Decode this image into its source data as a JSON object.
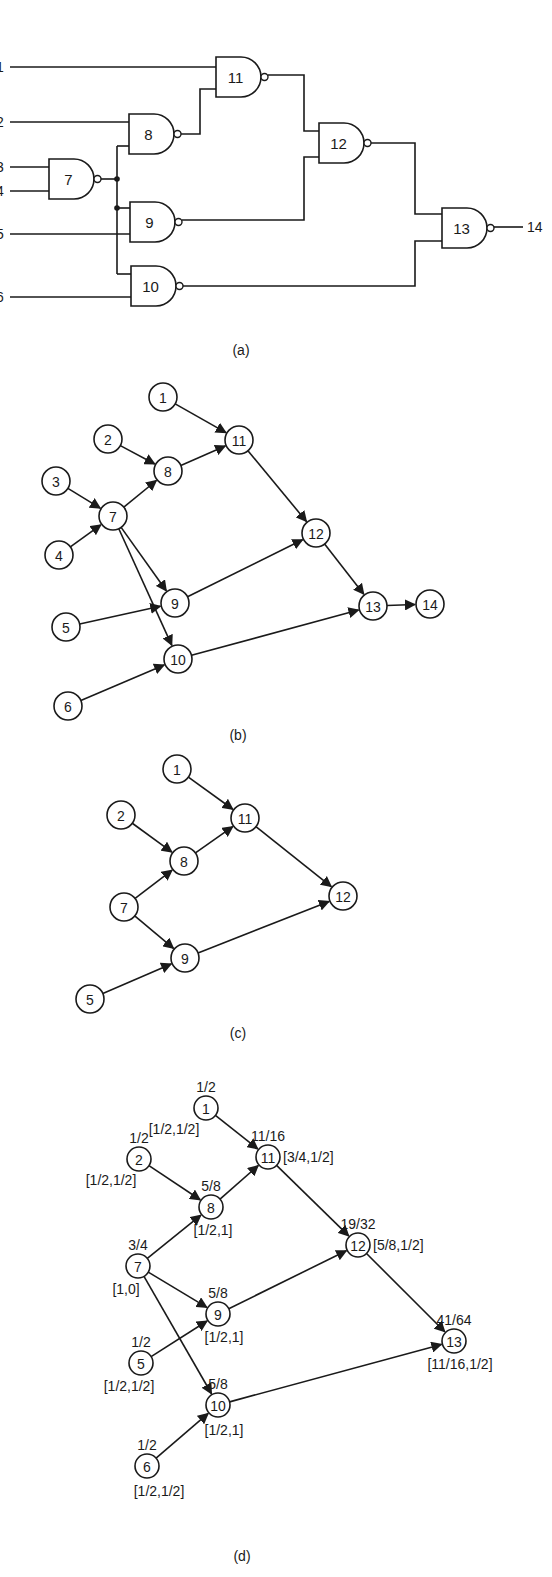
{
  "figure": {
    "panel_a": {
      "caption": "(a)",
      "input_labels": [
        {
          "id": "1",
          "label": "1",
          "x": 0,
          "y": 67
        },
        {
          "id": "2",
          "label": "2",
          "x": 0,
          "y": 122
        },
        {
          "id": "3",
          "label": "3",
          "x": 0,
          "y": 167
        },
        {
          "id": "4",
          "label": "4",
          "x": 0,
          "y": 191
        },
        {
          "id": "5",
          "label": "5",
          "x": 0,
          "y": 234
        },
        {
          "id": "6",
          "label": "6",
          "x": 0,
          "y": 297
        }
      ],
      "gates": [
        {
          "id": "7",
          "label": "7",
          "type": "NAND",
          "x": 49,
          "y": 159,
          "w": 45,
          "h": 40
        },
        {
          "id": "8",
          "label": "8",
          "type": "NAND",
          "x": 129,
          "y": 114,
          "w": 45,
          "h": 40
        },
        {
          "id": "9",
          "label": "9",
          "type": "NAND",
          "x": 130,
          "y": 202,
          "w": 45,
          "h": 40
        },
        {
          "id": "10",
          "label": "10",
          "type": "NAND",
          "x": 131,
          "y": 266,
          "w": 45,
          "h": 40
        },
        {
          "id": "11",
          "label": "11",
          "type": "NAND",
          "x": 216,
          "y": 57,
          "w": 45,
          "h": 40
        },
        {
          "id": "12",
          "label": "12",
          "type": "NAND",
          "x": 319,
          "y": 123,
          "w": 45,
          "h": 40
        },
        {
          "id": "13",
          "label": "13",
          "type": "NAND",
          "x": 442,
          "y": 208,
          "w": 45,
          "h": 40
        }
      ],
      "output_label": "14"
    },
    "panel_b": {
      "caption": "(b)",
      "nodes": [
        {
          "id": "1",
          "label": "1",
          "x": 163,
          "y": 397
        },
        {
          "id": "2",
          "label": "2",
          "x": 108,
          "y": 439
        },
        {
          "id": "3",
          "label": "3",
          "x": 56,
          "y": 481
        },
        {
          "id": "4",
          "label": "4",
          "x": 59,
          "y": 555
        },
        {
          "id": "5",
          "label": "5",
          "x": 66,
          "y": 627
        },
        {
          "id": "6",
          "label": "6",
          "x": 68,
          "y": 706
        },
        {
          "id": "7",
          "label": "7",
          "x": 113,
          "y": 516
        },
        {
          "id": "8",
          "label": "8",
          "x": 168,
          "y": 471
        },
        {
          "id": "9",
          "label": "9",
          "x": 175,
          "y": 603
        },
        {
          "id": "10",
          "label": "10",
          "x": 178,
          "y": 659
        },
        {
          "id": "11",
          "label": "11",
          "x": 239,
          "y": 440
        },
        {
          "id": "12",
          "label": "12",
          "x": 316,
          "y": 533
        },
        {
          "id": "13",
          "label": "13",
          "x": 373,
          "y": 606
        },
        {
          "id": "14",
          "label": "14",
          "x": 430,
          "y": 604
        }
      ],
      "edges": [
        [
          "1",
          "11"
        ],
        [
          "2",
          "8"
        ],
        [
          "3",
          "7"
        ],
        [
          "4",
          "7"
        ],
        [
          "7",
          "8"
        ],
        [
          "7",
          "9"
        ],
        [
          "7",
          "10"
        ],
        [
          "5",
          "9"
        ],
        [
          "6",
          "10"
        ],
        [
          "8",
          "11"
        ],
        [
          "11",
          "12"
        ],
        [
          "9",
          "12"
        ],
        [
          "12",
          "13"
        ],
        [
          "10",
          "13"
        ],
        [
          "13",
          "14"
        ]
      ]
    },
    "panel_c": {
      "caption": "(c)",
      "nodes": [
        {
          "id": "1",
          "label": "1",
          "x": 177,
          "y": 769
        },
        {
          "id": "2",
          "label": "2",
          "x": 121,
          "y": 815
        },
        {
          "id": "11",
          "label": "11",
          "x": 245,
          "y": 818
        },
        {
          "id": "8",
          "label": "8",
          "x": 184,
          "y": 861
        },
        {
          "id": "7",
          "label": "7",
          "x": 124,
          "y": 907
        },
        {
          "id": "12",
          "label": "12",
          "x": 343,
          "y": 896
        },
        {
          "id": "9",
          "label": "9",
          "x": 185,
          "y": 958
        },
        {
          "id": "5",
          "label": "5",
          "x": 90,
          "y": 999
        }
      ],
      "edges": [
        [
          "1",
          "11"
        ],
        [
          "2",
          "8"
        ],
        [
          "7",
          "8"
        ],
        [
          "7",
          "9"
        ],
        [
          "5",
          "9"
        ],
        [
          "8",
          "11"
        ],
        [
          "11",
          "12"
        ],
        [
          "9",
          "12"
        ]
      ]
    },
    "panel_d": {
      "caption": "(d)",
      "nodes": [
        {
          "id": "1",
          "label": "1",
          "x": 206,
          "y": 1108,
          "prob": "1/2",
          "interval": "[1/2,1/2]"
        },
        {
          "id": "2",
          "label": "2",
          "x": 139,
          "y": 1159,
          "prob": "1/2",
          "interval": "[1/2,1/2]"
        },
        {
          "id": "11",
          "label": "11",
          "x": 268,
          "y": 1157,
          "prob": "11/16",
          "interval": "[3/4,1/2]"
        },
        {
          "id": "8",
          "label": "8",
          "x": 211,
          "y": 1207,
          "prob": "5/8",
          "interval": "[1/2,1]"
        },
        {
          "id": "7",
          "label": "7",
          "x": 138,
          "y": 1266,
          "prob": "3/4",
          "interval": "[1,0]"
        },
        {
          "id": "12",
          "label": "12",
          "x": 358,
          "y": 1245,
          "prob": "19/32",
          "interval": "[5/8,1/2]"
        },
        {
          "id": "9",
          "label": "9",
          "x": 218,
          "y": 1314,
          "prob": "5/8",
          "interval": "[1/2,1]"
        },
        {
          "id": "5",
          "label": "5",
          "x": 141,
          "y": 1363,
          "prob": "1/2",
          "interval": "[1/2,1/2]"
        },
        {
          "id": "13",
          "label": "13",
          "x": 454,
          "y": 1341,
          "prob": "41/64",
          "interval": "[11/16,1/2]"
        },
        {
          "id": "10",
          "label": "10",
          "x": 218,
          "y": 1405,
          "prob": "5/8",
          "interval": "[1/2,1]"
        },
        {
          "id": "6",
          "label": "6",
          "x": 147,
          "y": 1466,
          "prob": "1/2",
          "interval": "[1/2,1/2]"
        }
      ],
      "edges": [
        [
          "1",
          "11"
        ],
        [
          "2",
          "8"
        ],
        [
          "7",
          "8"
        ],
        [
          "7",
          "9"
        ],
        [
          "7",
          "10"
        ],
        [
          "5",
          "9"
        ],
        [
          "6",
          "10"
        ],
        [
          "8",
          "11"
        ],
        [
          "11",
          "12"
        ],
        [
          "9",
          "12"
        ],
        [
          "12",
          "13"
        ],
        [
          "10",
          "13"
        ]
      ]
    }
  }
}
